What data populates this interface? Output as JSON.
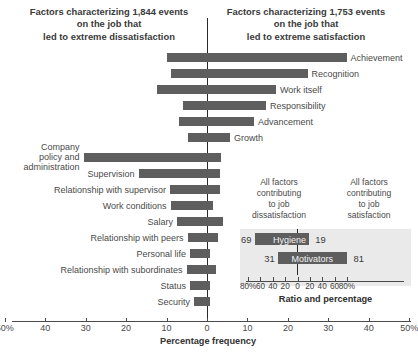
{
  "headers": {
    "left": [
      "Factors characterizing 1,844 events",
      "on the job that",
      "led to extreme dissatisfaction"
    ],
    "right": [
      "Factors characterizing 1,753 events",
      "on the job that",
      "led to extreme satisfaction"
    ]
  },
  "axis": {
    "title": "Percentage frequency",
    "ticks": [
      "50%",
      "40",
      "30",
      "20",
      "10",
      "0",
      "10",
      "20",
      "30",
      "40",
      "50%"
    ],
    "tick_values": [
      -50,
      -40,
      -30,
      -20,
      -10,
      0,
      10,
      20,
      30,
      40,
      50
    ]
  },
  "inset": {
    "header_left": [
      "All factors",
      "contributing",
      "to job",
      "dissatisfaction"
    ],
    "header_right": [
      "All factors",
      "contributing",
      "to job",
      "satisfaction"
    ],
    "title": "Ratio and percentage",
    "ticks": [
      "80%",
      "60",
      "40",
      "20",
      "0",
      "20",
      "40",
      "60",
      "80%"
    ],
    "tick_values": [
      -80,
      -60,
      -40,
      -20,
      0,
      20,
      40,
      60,
      80
    ],
    "rows": [
      {
        "name": "Hygiene",
        "left": 69,
        "right": 19
      },
      {
        "name": "Motivators",
        "left": 31,
        "right": 81
      }
    ]
  },
  "colors": {
    "bar": "#5e5e5e",
    "axis": "#4a4a4a",
    "inset_bg": "#eaeaea",
    "text": "#4a4a4a",
    "background": "#ffffff"
  },
  "chart_data": {
    "type": "bar",
    "subtitle_left": "Factors characterizing 1,844 events on the job that led to extreme dissatisfaction",
    "subtitle_right": "Factors characterizing 1,753 events on the job that led to extreme satisfaction",
    "orientation": "horizontal-diverging",
    "xlabel": "Percentage frequency",
    "ylabel": "",
    "xlim": [
      -50,
      50
    ],
    "xticks": [
      -50,
      -40,
      -30,
      -20,
      -10,
      0,
      10,
      20,
      30,
      40,
      50
    ],
    "xticklabels": [
      "50%",
      "40",
      "30",
      "20",
      "10",
      "0",
      "10",
      "20",
      "30",
      "40",
      "50%"
    ],
    "grid": false,
    "legend": null,
    "categories": [
      "Achievement",
      "Recognition",
      "Work itself",
      "Responsibility",
      "Advancement",
      "Growth",
      "Company policy and administration",
      "Supervision",
      "Relationship with supervisor",
      "Work conditions",
      "Salary",
      "Relationship with peers",
      "Personal life",
      "Relationship with subordinates",
      "Status",
      "Security"
    ],
    "series": [
      {
        "name": "Dissatisfaction (left of zero)",
        "values": [
          10,
          9,
          12,
          6,
          7,
          5,
          31,
          17,
          9,
          9,
          7,
          5,
          4,
          5,
          4,
          3
        ]
      },
      {
        "name": "Satisfaction (right of zero)",
        "values": [
          34,
          25,
          17,
          15,
          12,
          6,
          3.5,
          3,
          3,
          1.5,
          4,
          2.5,
          0.5,
          2,
          0.5,
          0.5
        ]
      }
    ],
    "inset_chart": {
      "type": "bar",
      "title": "Ratio and percentage",
      "xlim": [
        -100,
        100
      ],
      "xticks": [
        -80,
        -60,
        -40,
        -20,
        0,
        20,
        40,
        60,
        80
      ],
      "xticklabels": [
        "80%",
        "60",
        "40",
        "20",
        "0",
        "20",
        "40",
        "60",
        "80%"
      ],
      "categories": [
        "Hygiene",
        "Motivators"
      ],
      "series": [
        {
          "name": "contributing to job dissatisfaction",
          "values": [
            69,
            31
          ]
        },
        {
          "name": "contributing to job satisfaction",
          "values": [
            19,
            81
          ]
        }
      ]
    }
  },
  "bars": [
    {
      "label": "Achievement",
      "neg": 10,
      "pos": 34,
      "side": "right",
      "x1": 166.5,
      "x2": 346.5,
      "y": 53
    },
    {
      "label": "Recognition",
      "neg": 9,
      "pos": 25,
      "side": "right",
      "x1": 171.0,
      "x2": 307.5,
      "y": 69
    },
    {
      "label": "Work itself",
      "neg": 12,
      "pos": 17,
      "side": "right",
      "x1": 157.0,
      "x2": 276.0,
      "y": 85
    },
    {
      "label": "Responsibility",
      "neg": 6,
      "pos": 15,
      "side": "right",
      "x1": 182.5,
      "x2": 266.0,
      "y": 101
    },
    {
      "label": "Advancement",
      "neg": 7,
      "pos": 12,
      "side": "right",
      "x1": 179.0,
      "x2": 254.0,
      "y": 117
    },
    {
      "label": "Growth",
      "neg": 5,
      "pos": 6,
      "side": "right",
      "x1": 187.5,
      "x2": 230.0,
      "y": 133
    },
    {
      "label": "Company policy and administration",
      "neg": 31,
      "pos": 3.5,
      "side": "left",
      "x1": 83.5,
      "x2": 220.5,
      "y": 153
    },
    {
      "label": "Supervision",
      "neg": 17,
      "pos": 3,
      "side": "left",
      "x1": 138.5,
      "x2": 219.5,
      "y": 169
    },
    {
      "label": "Relationship with supervisor",
      "neg": 9,
      "pos": 3,
      "side": "left",
      "x1": 170.0,
      "x2": 219.5,
      "y": 185
    },
    {
      "label": "Work conditions",
      "neg": 9,
      "pos": 1.5,
      "side": "left",
      "x1": 170.5,
      "x2": 213.0,
      "y": 201
    },
    {
      "label": "Salary",
      "neg": 7,
      "pos": 4,
      "side": "left",
      "x1": 177.0,
      "x2": 223.0,
      "y": 217
    },
    {
      "label": "Relationship with peers",
      "neg": 5,
      "pos": 2.5,
      "side": "left",
      "x1": 187.5,
      "x2": 217.5,
      "y": 233
    },
    {
      "label": "Personal life",
      "neg": 4,
      "pos": 0.5,
      "side": "left",
      "x1": 190.0,
      "x2": 209.5,
      "y": 249
    },
    {
      "label": "Relationship with subordinates",
      "neg": 5,
      "pos": 2,
      "side": "left",
      "x1": 186.5,
      "x2": 216.0,
      "y": 265
    },
    {
      "label": "Status",
      "neg": 4,
      "pos": 0.5,
      "side": "left",
      "x1": 190.0,
      "x2": 209.5,
      "y": 281
    },
    {
      "label": "Security",
      "neg": 3,
      "pos": 0.5,
      "side": "left",
      "x1": 194.0,
      "x2": 209.5,
      "y": 297
    }
  ]
}
